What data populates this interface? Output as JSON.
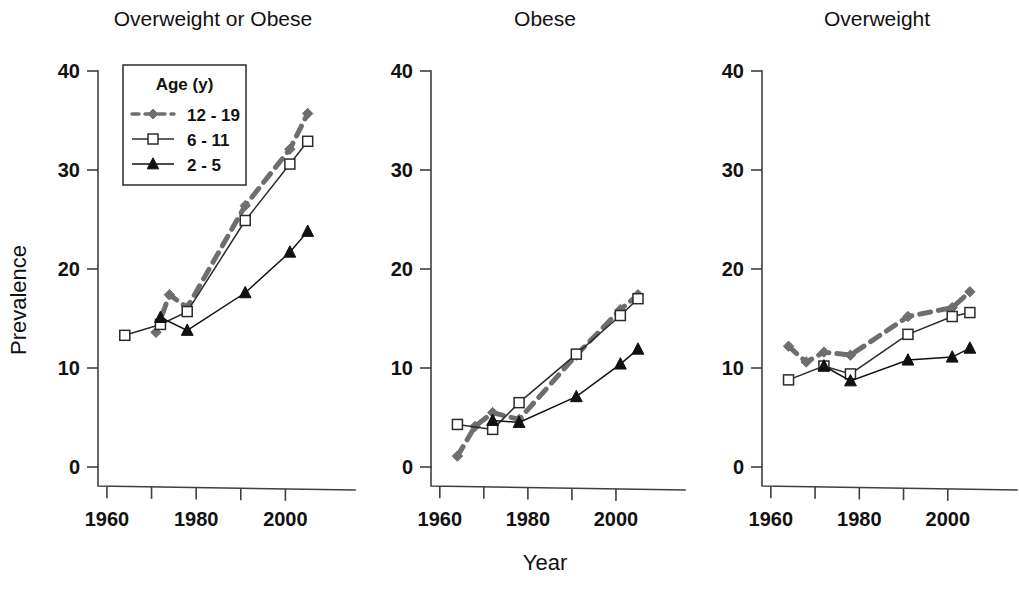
{
  "figure": {
    "xlabel": "Year",
    "ylabel": "Prevalence"
  },
  "legend": {
    "title": "Age (y)",
    "items": [
      {
        "label": "12 - 19",
        "marker": "diamond",
        "style": "dashed",
        "color": "#6e6e6e"
      },
      {
        "label": "6 - 11",
        "marker": "open-square",
        "style": "solid",
        "color": "#2b2b2b"
      },
      {
        "label": "2 - 5",
        "marker": "filled-triangle",
        "style": "solid",
        "color": "#111111"
      }
    ]
  },
  "chart_data": [
    {
      "type": "line",
      "title": "Overweight or Obese",
      "xlabel": "Year",
      "ylabel": "Prevalence",
      "xlim": [
        1958,
        2010
      ],
      "ylim": [
        0,
        42
      ],
      "xticks": [
        1960,
        1970,
        1980,
        1990,
        2000
      ],
      "xticklabels": [
        "1960",
        "",
        "1980",
        "",
        "2000"
      ],
      "yticks": [
        0,
        10,
        20,
        30,
        40
      ],
      "yticklabels": [
        "0",
        "10",
        "20",
        "30",
        "40"
      ],
      "grid": false,
      "legend_position": "upper-left",
      "series": [
        {
          "name": "12 - 19",
          "marker": "diamond",
          "style": "dashed",
          "color": "#6e6e6e",
          "x": [
            1971,
            1974,
            1978,
            1991,
            2001,
            2005
          ],
          "y": [
            13.6,
            17.4,
            16.1,
            26.4,
            32.1,
            35.7
          ]
        },
        {
          "name": "6 - 11",
          "marker": "open-square",
          "style": "solid",
          "color": "#2b2b2b",
          "x": [
            1964,
            1972,
            1978,
            1991,
            2001,
            2005
          ],
          "y": [
            13.3,
            14.4,
            15.7,
            24.9,
            30.6,
            32.9
          ]
        },
        {
          "name": "2 - 5",
          "marker": "filled-triangle",
          "style": "solid",
          "color": "#111111",
          "x": [
            1972,
            1978,
            1991,
            2001,
            2005
          ],
          "y": [
            15.1,
            13.8,
            17.6,
            21.7,
            23.8
          ]
        }
      ]
    },
    {
      "type": "line",
      "title": "Obese",
      "xlabel": "Year",
      "ylabel": "",
      "xlim": [
        1958,
        2010
      ],
      "ylim": [
        0,
        42
      ],
      "xticks": [
        1960,
        1970,
        1980,
        1990,
        2000
      ],
      "xticklabels": [
        "1960",
        "",
        "1980",
        "",
        "2000"
      ],
      "yticks": [
        0,
        10,
        20,
        30,
        40
      ],
      "yticklabels": [
        "0",
        "10",
        "20",
        "30",
        "40"
      ],
      "grid": false,
      "legend_position": "none",
      "series": [
        {
          "name": "12 - 19",
          "marker": "diamond",
          "style": "dashed",
          "color": "#6e6e6e",
          "x": [
            1964,
            1968,
            1972,
            1978,
            1991,
            2001,
            2005
          ],
          "y": [
            1.1,
            4.1,
            5.5,
            4.8,
            11.3,
            15.9,
            17.4
          ]
        },
        {
          "name": "6 - 11",
          "marker": "open-square",
          "style": "solid",
          "color": "#2b2b2b",
          "x": [
            1964,
            1972,
            1978,
            1991,
            2001,
            2005
          ],
          "y": [
            4.3,
            3.8,
            6.5,
            11.4,
            15.3,
            17.0
          ]
        },
        {
          "name": "2 - 5",
          "marker": "filled-triangle",
          "style": "solid",
          "color": "#111111",
          "x": [
            1972,
            1978,
            1991,
            2001,
            2005
          ],
          "y": [
            4.7,
            4.5,
            7.1,
            10.4,
            11.9
          ]
        }
      ]
    },
    {
      "type": "line",
      "title": "Overweight",
      "xlabel": "Year",
      "ylabel": "",
      "xlim": [
        1958,
        2010
      ],
      "ylim": [
        0,
        42
      ],
      "xticks": [
        1960,
        1970,
        1980,
        1990,
        2000
      ],
      "xticklabels": [
        "1960",
        "",
        "1980",
        "",
        "2000"
      ],
      "yticks": [
        0,
        10,
        20,
        30,
        40
      ],
      "yticklabels": [
        "0",
        "10",
        "20",
        "30",
        "40"
      ],
      "grid": false,
      "legend_position": "none",
      "series": [
        {
          "name": "12 - 19",
          "marker": "diamond",
          "style": "dashed",
          "color": "#6e6e6e",
          "x": [
            1964,
            1968,
            1972,
            1978,
            1991,
            2001,
            2005
          ],
          "y": [
            12.2,
            10.6,
            11.6,
            11.3,
            15.2,
            16.1,
            17.7
          ]
        },
        {
          "name": "6 - 11",
          "marker": "open-square",
          "style": "solid",
          "color": "#2b2b2b",
          "x": [
            1964,
            1972,
            1978,
            1991,
            2001,
            2005
          ],
          "y": [
            8.8,
            10.2,
            9.4,
            13.4,
            15.2,
            15.6
          ]
        },
        {
          "name": "2 - 5",
          "marker": "filled-triangle",
          "style": "solid",
          "color": "#111111",
          "x": [
            1972,
            1978,
            1991,
            2001,
            2005
          ],
          "y": [
            10.2,
            8.7,
            10.8,
            11.1,
            12.0
          ]
        }
      ]
    }
  ]
}
